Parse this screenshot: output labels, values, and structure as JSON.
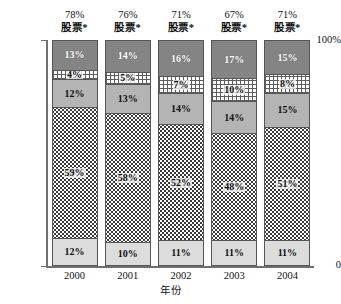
{
  "axes": {
    "y_top_label": "100%",
    "y_bottom_label": "0",
    "x_title": "年份"
  },
  "chart_data": {
    "type": "bar",
    "title": "",
    "subtitle": "",
    "xlabel": "年份",
    "ylabel": "",
    "ylim": [
      0,
      100
    ],
    "grid": false,
    "legend_position": "none",
    "stacked": true,
    "stack_total": 100,
    "categories": [
      "2000",
      "2001",
      "2002",
      "2003",
      "2004"
    ],
    "series": [
      {
        "name": "segment-1-bottom",
        "fill": "light-gray",
        "values": [
          12,
          10,
          11,
          11,
          11
        ]
      },
      {
        "name": "segment-2",
        "fill": "dotted",
        "values": [
          59,
          58,
          52,
          48,
          51
        ]
      },
      {
        "name": "segment-3",
        "fill": "medium-gray",
        "values": [
          12,
          13,
          14,
          14,
          15
        ]
      },
      {
        "name": "segment-4",
        "fill": "checkered-white",
        "values": [
          4,
          5,
          7,
          10,
          8
        ]
      },
      {
        "name": "segment-5-top",
        "fill": "dark-gray",
        "values": [
          13,
          14,
          16,
          17,
          15
        ]
      }
    ],
    "annotations": [
      {
        "category": "2000",
        "percent": "78%",
        "label": "股票*"
      },
      {
        "category": "2001",
        "percent": "76%",
        "label": "股票*"
      },
      {
        "category": "2002",
        "percent": "71%",
        "label": "股票*"
      },
      {
        "category": "2003",
        "percent": "67%",
        "label": "股票*"
      },
      {
        "category": "2004",
        "percent": "71%",
        "label": "股票*"
      }
    ],
    "bar_segment_labels": [
      [
        "12%",
        "59%",
        "12%",
        "4%",
        "13%"
      ],
      [
        "10%",
        "58%",
        "13%",
        "5%",
        "14%"
      ],
      [
        "11%",
        "52%",
        "14%",
        "7%",
        "16%"
      ],
      [
        "11%",
        "48%",
        "14%",
        "10%",
        "17%"
      ],
      [
        "11%",
        "51%",
        "15%",
        "8%",
        "15%"
      ]
    ]
  },
  "colors": {
    "dark_gray": "#848484",
    "medium_gray": "#b4b4b4",
    "light_gray": "#dcdcdc",
    "checkered_line": "#5d5d5d",
    "dot": "#3a3a3a",
    "axis": "#6f6f6f",
    "border": "#555555"
  }
}
